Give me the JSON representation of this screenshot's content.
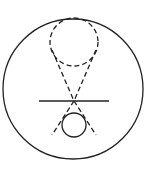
{
  "diagram": {
    "width": 151,
    "height": 181,
    "background": "#ffffff",
    "stroke_color": "#222222",
    "dash_pattern": "5 3",
    "outer_circle": {
      "cx": 73,
      "cy": 89,
      "r": 70,
      "style": "solid"
    },
    "upper_dashed_circle": {
      "cx": 74,
      "cy": 42,
      "r": 24,
      "style": "dashed"
    },
    "lower_circle": {
      "cx": 74,
      "cy": 125,
      "r": 12,
      "style": "solid"
    },
    "horizontal_line": {
      "x1": 39,
      "y1": 101,
      "x2": 109,
      "y2": 101,
      "style": "solid"
    },
    "crossing_point": {
      "x": 74,
      "y": 101
    },
    "dashed_lines": [
      {
        "name": "left-upper",
        "x1": 52,
        "y1": 50,
        "x2": 74,
        "y2": 101
      },
      {
        "name": "right-upper",
        "x1": 96,
        "y1": 50,
        "x2": 74,
        "y2": 101
      },
      {
        "name": "left-lower",
        "x1": 74,
        "y1": 101,
        "x2": 52,
        "y2": 135
      },
      {
        "name": "right-lower",
        "x1": 74,
        "y1": 101,
        "x2": 96,
        "y2": 135
      }
    ]
  }
}
